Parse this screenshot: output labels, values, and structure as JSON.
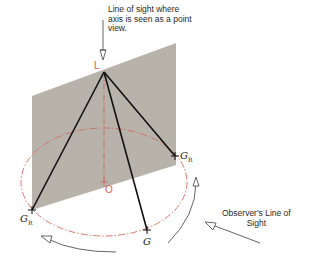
{
  "labels": {
    "top_caption": "Line of sight where\naxis is seen as a point\nview.",
    "observer_caption": "Observer's Line of\nSight",
    "point_L": "L",
    "point_O": "O",
    "point_G": "G",
    "point_GR_right": "G",
    "point_GR_right_sub": "R",
    "point_GR_left": "G",
    "point_GR_left_sub": "R"
  },
  "colors": {
    "plane": "#b5b1a8",
    "lines": "#111111",
    "ellipse": "#d26a60",
    "arrows": "#555555"
  }
}
